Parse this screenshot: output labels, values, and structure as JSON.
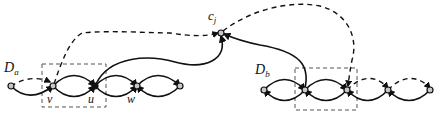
{
  "diagram": {
    "labels": {
      "c_j": "c",
      "c_j_sub": "j",
      "D_a": "D",
      "D_a_sub": "a",
      "D_b": "D",
      "D_b_sub": "b",
      "v": "v",
      "u": "u",
      "w": "w"
    },
    "groups": [
      {
        "name": "D_a",
        "nodes": [
          "a0",
          "v",
          "u",
          "w",
          "a4"
        ]
      },
      {
        "name": "D_b",
        "nodes": [
          "b0",
          "b1",
          "b2",
          "b3",
          "b4"
        ]
      }
    ],
    "clause_node": "c_j",
    "edges": [
      {
        "from": "u",
        "to": "c_j",
        "style": "solid"
      },
      {
        "from": "b1",
        "to": "c_j",
        "style": "solid"
      },
      {
        "from": "v",
        "to": "c_j",
        "style": "dashed"
      },
      {
        "from": "c_j",
        "to": "b2",
        "style": "dashed"
      }
    ],
    "colors": {
      "stroke": "#111111",
      "node_fill": "#c8c8c8",
      "box": "#555555"
    }
  }
}
